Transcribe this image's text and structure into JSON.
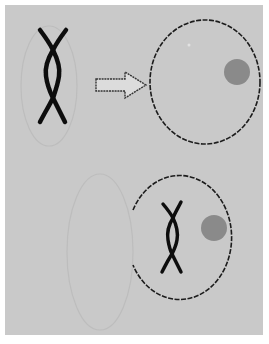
{
  "figure": {
    "title": "Cell fusion diagram",
    "colors": {
      "background": "#ffffff",
      "panel": "#c9c9c9",
      "faint_outline": "#bdbdbd",
      "membrane": "#1c1c1c",
      "chromosome": "#111111",
      "nucleolus": "#8a8a8a",
      "arrow_fill": "#dcdcdc",
      "arrow_stroke": "#333333"
    },
    "top_row": {
      "left": "Faint oval cell containing a twisted chromosome pair",
      "arrow": "Hollow right-pointing arrow",
      "right": "Large cell with dashed-looking membrane and a gray nucleolus"
    },
    "bottom_row": {
      "left": "Faint empty oval cell",
      "right": "Cell open on its left side containing a twisted chromosome pair and a gray nucleolus"
    }
  }
}
